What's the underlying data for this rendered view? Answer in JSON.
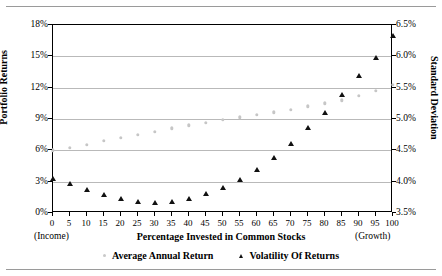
{
  "chart_data": {
    "type": "scatter",
    "title": "",
    "xlabel": "Percentage Invested in Common Stocks",
    "xlabel_left_note": "(Income)",
    "xlabel_right_note": "(Growth)",
    "ylabel": "Portfolio Returns",
    "ylabel_secondary": "Standard Deviation",
    "grid": true,
    "legend_position": "bottom",
    "x": [
      0,
      5,
      10,
      15,
      20,
      25,
      30,
      35,
      40,
      45,
      50,
      55,
      60,
      65,
      70,
      75,
      80,
      85,
      90,
      95,
      100
    ],
    "xticks": [
      "0",
      "5",
      "10",
      "15",
      "20",
      "25",
      "30",
      "35",
      "40",
      "45",
      "50",
      "55",
      "60",
      "65",
      "70",
      "75",
      "80",
      "85",
      "90",
      "95",
      "100"
    ],
    "xlim": [
      0,
      100
    ],
    "ylim": [
      0,
      18
    ],
    "yticks": [
      "0%",
      "3%",
      "6%",
      "9%",
      "12%",
      "15%",
      "18%"
    ],
    "ytick_values": [
      0,
      3,
      6,
      9,
      12,
      15,
      18
    ],
    "ylim_secondary": [
      3.5,
      6.5
    ],
    "yticks_secondary": [
      "3.5%",
      "4.0%",
      "4.5%",
      "5.0%",
      "5.5%",
      "6.0%",
      "6.5%"
    ],
    "ytick_values_secondary": [
      3.5,
      4.0,
      4.5,
      5.0,
      5.5,
      6.0,
      6.5
    ],
    "series": [
      {
        "name": "Average Annual Return",
        "axis": "left",
        "marker": "dot",
        "color": "#c6c6c6",
        "values": [
          6.0,
          6.25,
          6.55,
          6.9,
          7.2,
          7.5,
          7.8,
          8.1,
          8.4,
          8.65,
          8.9,
          9.15,
          9.4,
          9.65,
          9.9,
          10.2,
          10.5,
          10.8,
          11.2,
          11.7,
          12.3
        ]
      },
      {
        "name": "Volatility Of Returns",
        "axis": "right",
        "marker": "triangle",
        "color": "#111111",
        "values": [
          4.05,
          3.96,
          3.86,
          3.78,
          3.72,
          3.68,
          3.66,
          3.68,
          3.72,
          3.8,
          3.9,
          4.02,
          4.18,
          4.38,
          4.6,
          4.85,
          5.1,
          5.38,
          5.68,
          5.98,
          6.32
        ]
      }
    ]
  },
  "legend": {
    "items": [
      {
        "label": "Average Annual Return",
        "marker": "dot"
      },
      {
        "label": "Volatility Of Returns",
        "marker": "triangle"
      }
    ]
  }
}
